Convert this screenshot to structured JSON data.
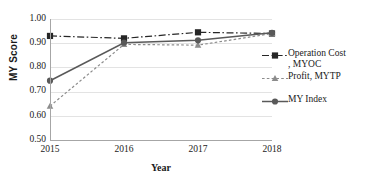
{
  "chart_data": {
    "type": "line",
    "title": "",
    "xlabel": "Year",
    "ylabel": "MY Score",
    "categories": [
      "2015",
      "2016",
      "2017",
      "2018"
    ],
    "x": [
      2015,
      2016,
      2017,
      2018
    ],
    "ylim": [
      0.5,
      1.0
    ],
    "ytick_labels": [
      "1.00",
      "0.90",
      "0.80",
      "0.70",
      "0.60",
      "0.50"
    ],
    "ytick_values": [
      1.0,
      0.9,
      0.8,
      0.7,
      0.6,
      0.5
    ],
    "grid": true,
    "legend_position": "right",
    "series": [
      {
        "name": "Operation Cost , MYOC",
        "key": "MYOC",
        "values": [
          0.93,
          0.92,
          0.945,
          0.94
        ],
        "color": "#262626",
        "line_style": "dash-dot",
        "marker": "square"
      },
      {
        "name": "Profit, MYTP",
        "key": "MYTP",
        "values": [
          0.64,
          0.895,
          0.892,
          0.94
        ],
        "color": "#8c8c8c",
        "line_style": "dotted",
        "marker": "triangle"
      },
      {
        "name": "MY Index",
        "key": "MY Index",
        "values": [
          0.745,
          0.902,
          0.912,
          0.943
        ],
        "color": "#595959",
        "line_style": "solid",
        "marker": "circle"
      }
    ]
  },
  "legend": {
    "entries": [
      {
        "label_line1": "Operation Cost",
        "label_line2": ", MYOC"
      },
      {
        "label_line1": "Profit, MYTP",
        "label_line2": ""
      },
      {
        "label_line1": "MY Index",
        "label_line2": ""
      }
    ]
  },
  "axes": {
    "y_title": "MY Score",
    "x_title": "Year"
  }
}
